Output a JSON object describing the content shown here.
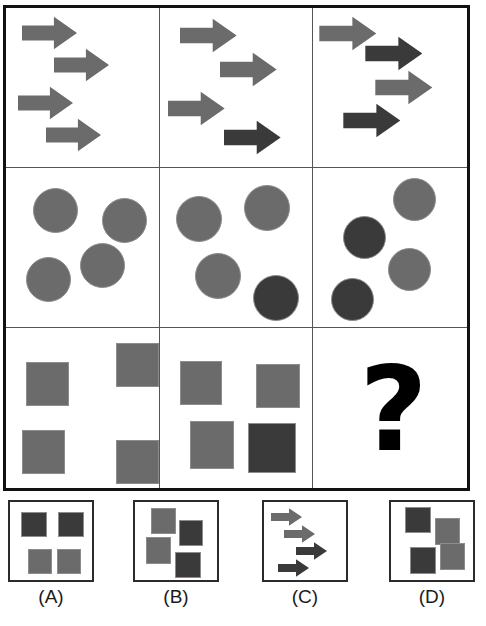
{
  "puzzle": {
    "type": "visual-analogy-matrix",
    "title": "",
    "palette": {
      "light_gray": "#6b6b6b",
      "dark_gray": "#3a3a3a",
      "outline": "#8d8d8d",
      "grid_border": "#111111",
      "grid_divider": "#555555",
      "black": "#000000",
      "background": "#ffffff"
    },
    "matrix": {
      "rows": 3,
      "cols": 3,
      "cells": [
        {
          "id": "cell-r1c1",
          "shape_kind": "arrow",
          "count": 4,
          "missing": false,
          "shapes": [
            {
              "name": "arrow-1",
              "tone": "light",
              "x": 16,
              "y": 8,
              "w": 55,
              "h": 34
            },
            {
              "name": "arrow-2",
              "tone": "light",
              "x": 48,
              "y": 40,
              "w": 55,
              "h": 34
            },
            {
              "name": "arrow-3",
              "tone": "light",
              "x": 12,
              "y": 78,
              "w": 55,
              "h": 34
            },
            {
              "name": "arrow-4",
              "tone": "light",
              "x": 40,
              "y": 110,
              "w": 55,
              "h": 34
            }
          ]
        },
        {
          "id": "cell-r1c2",
          "shape_kind": "arrow",
          "count": 4,
          "missing": false,
          "shapes": [
            {
              "name": "arrow-1",
              "tone": "light",
              "x": 20,
              "y": 10,
              "w": 57,
              "h": 35
            },
            {
              "name": "arrow-2",
              "tone": "light",
              "x": 60,
              "y": 44,
              "w": 57,
              "h": 35
            },
            {
              "name": "arrow-3",
              "tone": "light",
              "x": 8,
              "y": 83,
              "w": 57,
              "h": 35
            },
            {
              "name": "arrow-4",
              "tone": "dark",
              "x": 64,
              "y": 112,
              "w": 57,
              "h": 35
            }
          ]
        },
        {
          "id": "cell-r1c3",
          "shape_kind": "arrow",
          "count": 4,
          "missing": false,
          "shapes": [
            {
              "name": "arrow-1",
              "tone": "light",
              "x": 6,
              "y": 8,
              "w": 57,
              "h": 35
            },
            {
              "name": "arrow-2",
              "tone": "dark",
              "x": 52,
              "y": 28,
              "w": 57,
              "h": 35
            },
            {
              "name": "arrow-3",
              "tone": "light",
              "x": 62,
              "y": 62,
              "w": 57,
              "h": 35
            },
            {
              "name": "arrow-4",
              "tone": "dark",
              "x": 30,
              "y": 95,
              "w": 57,
              "h": 35
            }
          ]
        },
        {
          "id": "cell-r2c1",
          "shape_kind": "circle",
          "count": 4,
          "missing": false,
          "shapes": [
            {
              "name": "circle-1",
              "tone": "light",
              "x": 27,
              "y": 20,
              "w": 45,
              "h": 45
            },
            {
              "name": "circle-2",
              "tone": "light",
              "x": 96,
              "y": 30,
              "w": 45,
              "h": 45
            },
            {
              "name": "circle-3",
              "tone": "light",
              "x": 74,
              "y": 75,
              "w": 45,
              "h": 45
            },
            {
              "name": "circle-4",
              "tone": "light",
              "x": 20,
              "y": 89,
              "w": 45,
              "h": 45
            }
          ]
        },
        {
          "id": "cell-r2c2",
          "shape_kind": "circle",
          "count": 4,
          "missing": false,
          "shapes": [
            {
              "name": "circle-1",
              "tone": "light",
              "x": 16,
              "y": 28,
              "w": 46,
              "h": 46
            },
            {
              "name": "circle-2",
              "tone": "light",
              "x": 84,
              "y": 17,
              "w": 46,
              "h": 46
            },
            {
              "name": "circle-3",
              "tone": "light",
              "x": 35,
              "y": 85,
              "w": 46,
              "h": 46
            },
            {
              "name": "circle-4",
              "tone": "dark",
              "x": 93,
              "y": 107,
              "w": 46,
              "h": 46
            }
          ]
        },
        {
          "id": "cell-r2c3",
          "shape_kind": "circle",
          "count": 4,
          "missing": false,
          "shapes": [
            {
              "name": "circle-1",
              "tone": "light",
              "x": 80,
              "y": 10,
              "w": 43,
              "h": 43
            },
            {
              "name": "circle-2",
              "tone": "dark",
              "x": 30,
              "y": 48,
              "w": 43,
              "h": 43
            },
            {
              "name": "circle-3",
              "tone": "light",
              "x": 75,
              "y": 80,
              "w": 43,
              "h": 43
            },
            {
              "name": "circle-4",
              "tone": "dark",
              "x": 18,
              "y": 110,
              "w": 43,
              "h": 43
            }
          ]
        },
        {
          "id": "cell-r3c1",
          "shape_kind": "square",
          "count": 4,
          "missing": false,
          "shapes": [
            {
              "name": "square-1",
              "tone": "light",
              "x": 20,
              "y": 34,
              "w": 43,
              "h": 44
            },
            {
              "name": "square-2",
              "tone": "light",
              "x": 110,
              "y": 15,
              "w": 43,
              "h": 44
            },
            {
              "name": "square-3",
              "tone": "light",
              "x": 16,
              "y": 102,
              "w": 43,
              "h": 44
            },
            {
              "name": "square-4",
              "tone": "light",
              "x": 110,
              "y": 112,
              "w": 43,
              "h": 44
            }
          ]
        },
        {
          "id": "cell-r3c2",
          "shape_kind": "square",
          "count": 4,
          "missing": false,
          "shapes": [
            {
              "name": "square-1",
              "tone": "light",
              "x": 20,
              "y": 33,
              "w": 42,
              "h": 44
            },
            {
              "name": "square-2",
              "tone": "light",
              "x": 96,
              "y": 36,
              "w": 44,
              "h": 44
            },
            {
              "name": "square-3",
              "tone": "light",
              "x": 30,
              "y": 93,
              "w": 44,
              "h": 48
            },
            {
              "name": "square-4",
              "tone": "dark",
              "x": 88,
              "y": 95,
              "w": 48,
              "h": 50
            }
          ]
        },
        {
          "id": "cell-r3c3",
          "shape_kind": "question",
          "count": 0,
          "missing": true,
          "missing_glyph": "?",
          "shapes": []
        }
      ]
    },
    "answers": {
      "labels": [
        "(A)",
        "(B)",
        "(C)",
        "(D)"
      ],
      "options": [
        {
          "id": "option-a",
          "label": "(A)",
          "shape_kind": "square",
          "count": 4,
          "left": 8,
          "shapes": [
            {
              "name": "square-1",
              "tone": "dark",
              "x": 11,
              "y": 10,
              "w": 26,
              "h": 25
            },
            {
              "name": "square-2",
              "tone": "dark",
              "x": 48,
              "y": 10,
              "w": 26,
              "h": 25
            },
            {
              "name": "square-3",
              "tone": "light",
              "x": 18,
              "y": 47,
              "w": 24,
              "h": 25
            },
            {
              "name": "square-4",
              "tone": "light",
              "x": 47,
              "y": 47,
              "w": 24,
              "h": 25
            }
          ]
        },
        {
          "id": "option-b",
          "label": "(B)",
          "shape_kind": "square",
          "count": 4,
          "left": 133,
          "shapes": [
            {
              "name": "square-1",
              "tone": "light",
              "x": 16,
              "y": 6,
              "w": 25,
              "h": 26
            },
            {
              "name": "square-2",
              "tone": "dark",
              "x": 44,
              "y": 18,
              "w": 24,
              "h": 26
            },
            {
              "name": "square-3",
              "tone": "light",
              "x": 11,
              "y": 35,
              "w": 25,
              "h": 27
            },
            {
              "name": "square-4",
              "tone": "dark",
              "x": 40,
              "y": 50,
              "w": 26,
              "h": 26
            }
          ]
        },
        {
          "id": "option-c",
          "label": "(C)",
          "shape_kind": "arrow",
          "count": 4,
          "left": 262,
          "shapes": [
            {
              "name": "arrow-1",
              "tone": "light",
              "x": 7,
              "y": 6,
              "w": 31,
              "h": 18
            },
            {
              "name": "arrow-2",
              "tone": "light",
              "x": 20,
              "y": 23,
              "w": 31,
              "h": 18
            },
            {
              "name": "arrow-3",
              "tone": "dark",
              "x": 32,
              "y": 40,
              "w": 31,
              "h": 18
            },
            {
              "name": "arrow-4",
              "tone": "dark",
              "x": 14,
              "y": 57,
              "w": 31,
              "h": 18
            }
          ]
        },
        {
          "id": "option-d",
          "label": "(D)",
          "shape_kind": "square",
          "count": 4,
          "left": 389,
          "shapes": [
            {
              "name": "square-1",
              "tone": "dark",
              "x": 14,
              "y": 5,
              "w": 26,
              "h": 26
            },
            {
              "name": "square-2",
              "tone": "light",
              "x": 44,
              "y": 16,
              "w": 25,
              "h": 27
            },
            {
              "name": "square-3",
              "tone": "dark",
              "x": 19,
              "y": 45,
              "w": 26,
              "h": 27
            },
            {
              "name": "square-4",
              "tone": "light",
              "x": 49,
              "y": 41,
              "w": 25,
              "h": 27
            }
          ]
        }
      ]
    }
  }
}
